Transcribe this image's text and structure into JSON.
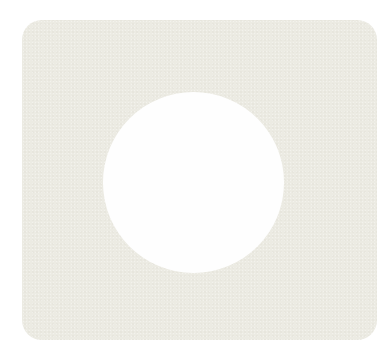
{
  "shape": {
    "name": "rounded square plate with circular cutout",
    "plate_color": "#ecebe3",
    "hole_color": "#fefefe",
    "background_color": "#ffffff"
  }
}
